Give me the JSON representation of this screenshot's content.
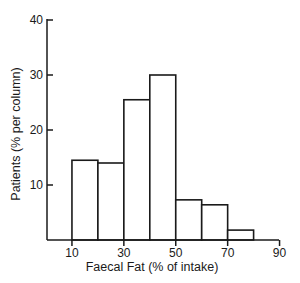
{
  "chart_data": {
    "type": "bar",
    "subtype": "histogram",
    "title": "",
    "xlabel": "Faecal Fat (% of intake)",
    "ylabel": "Patients (% per column)",
    "bins": [
      {
        "from": 10,
        "to": 20,
        "value": 14.5
      },
      {
        "from": 20,
        "to": 30,
        "value": 14
      },
      {
        "from": 30,
        "to": 40,
        "value": 25.5
      },
      {
        "from": 40,
        "to": 50,
        "value": 30
      },
      {
        "from": 50,
        "to": 60,
        "value": 7.3
      },
      {
        "from": 60,
        "to": 70,
        "value": 6.4
      },
      {
        "from": 70,
        "to": 80,
        "value": 1.8
      }
    ],
    "categories": [
      "10-20",
      "20-30",
      "30-40",
      "40-50",
      "50-60",
      "60-70",
      "70-80"
    ],
    "values": [
      14.5,
      14,
      25.5,
      30,
      7.3,
      6.4,
      1.8
    ],
    "xlim": [
      0,
      90
    ],
    "ylim": [
      0,
      40
    ],
    "x_ticks": [
      10,
      30,
      50,
      70,
      90
    ],
    "y_ticks": [
      10,
      20,
      30,
      40
    ],
    "grid": false,
    "legend": null,
    "colors": {
      "bar_fill": "#ffffff",
      "bar_stroke": "#1a1a1a",
      "axis": "#1a1a1a"
    }
  }
}
